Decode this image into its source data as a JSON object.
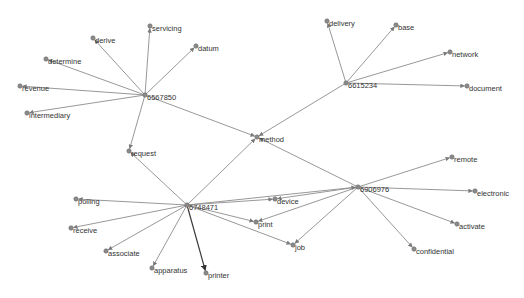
{
  "diagram": {
    "type": "network-graph",
    "nodes": [
      {
        "id": "6567850",
        "label": "6567850",
        "x": 145,
        "y": 95,
        "kind": "hub"
      },
      {
        "id": "6615234",
        "label": "6615234",
        "x": 346,
        "y": 83,
        "kind": "hub"
      },
      {
        "id": "6906976",
        "label": "6906976",
        "x": 358,
        "y": 187,
        "kind": "hub"
      },
      {
        "id": "6748471",
        "label": "6748471",
        "x": 187,
        "y": 205,
        "kind": "hub"
      },
      {
        "id": "method",
        "label": "method",
        "x": 257,
        "y": 137,
        "kind": "term"
      },
      {
        "id": "request",
        "label": "request",
        "x": 129,
        "y": 151,
        "kind": "term"
      },
      {
        "id": "servicing",
        "label": "servicing",
        "x": 150,
        "y": 26,
        "kind": "term"
      },
      {
        "id": "derive",
        "label": "derive",
        "x": 93,
        "y": 38,
        "kind": "term"
      },
      {
        "id": "datum",
        "label": "datum",
        "x": 196,
        "y": 46,
        "kind": "term"
      },
      {
        "id": "determine",
        "label": "determine",
        "x": 46,
        "y": 59,
        "kind": "term"
      },
      {
        "id": "revenue",
        "label": "revenue",
        "x": 20,
        "y": 86,
        "kind": "term"
      },
      {
        "id": "intermediary",
        "label": "intermediary",
        "x": 27,
        "y": 113,
        "kind": "term"
      },
      {
        "id": "delivery",
        "label": "delivery",
        "x": 327,
        "y": 21,
        "kind": "term"
      },
      {
        "id": "base",
        "label": "base",
        "x": 396,
        "y": 25,
        "kind": "term"
      },
      {
        "id": "network",
        "label": "network",
        "x": 450,
        "y": 52,
        "kind": "term"
      },
      {
        "id": "document",
        "label": "document",
        "x": 467,
        "y": 86,
        "kind": "term"
      },
      {
        "id": "remote",
        "label": "remote",
        "x": 452,
        "y": 157,
        "kind": "term"
      },
      {
        "id": "electronic",
        "label": "electronic",
        "x": 475,
        "y": 191,
        "kind": "term"
      },
      {
        "id": "activate",
        "label": "activate",
        "x": 457,
        "y": 224,
        "kind": "term"
      },
      {
        "id": "confidential",
        "label": "confidential",
        "x": 414,
        "y": 249,
        "kind": "term"
      },
      {
        "id": "polling",
        "label": "polling",
        "x": 76,
        "y": 199,
        "kind": "term"
      },
      {
        "id": "receive",
        "label": "receive",
        "x": 71,
        "y": 228,
        "kind": "term"
      },
      {
        "id": "associate",
        "label": "associate",
        "x": 106,
        "y": 251,
        "kind": "term"
      },
      {
        "id": "apparatus",
        "label": "apparatus",
        "x": 152,
        "y": 268,
        "kind": "term"
      },
      {
        "id": "printer",
        "label": "printer",
        "x": 206,
        "y": 273,
        "kind": "term"
      },
      {
        "id": "device",
        "label": "device",
        "x": 275,
        "y": 199,
        "kind": "term"
      },
      {
        "id": "print",
        "label": "print",
        "x": 256,
        "y": 222,
        "kind": "term"
      },
      {
        "id": "job",
        "label": "job",
        "x": 293,
        "y": 245,
        "kind": "term"
      }
    ],
    "edges": [
      {
        "from": "6567850",
        "to": "servicing"
      },
      {
        "from": "6567850",
        "to": "derive"
      },
      {
        "from": "6567850",
        "to": "datum"
      },
      {
        "from": "6567850",
        "to": "determine"
      },
      {
        "from": "6567850",
        "to": "revenue"
      },
      {
        "from": "6567850",
        "to": "intermediary"
      },
      {
        "from": "6567850",
        "to": "request"
      },
      {
        "from": "6567850",
        "to": "method"
      },
      {
        "from": "6615234",
        "to": "delivery"
      },
      {
        "from": "6615234",
        "to": "base"
      },
      {
        "from": "6615234",
        "to": "network"
      },
      {
        "from": "6615234",
        "to": "document"
      },
      {
        "from": "6615234",
        "to": "method"
      },
      {
        "from": "6906976",
        "to": "method"
      },
      {
        "from": "6906976",
        "to": "remote"
      },
      {
        "from": "6906976",
        "to": "electronic"
      },
      {
        "from": "6906976",
        "to": "activate"
      },
      {
        "from": "6906976",
        "to": "confidential"
      },
      {
        "from": "6906976",
        "to": "device"
      },
      {
        "from": "6906976",
        "to": "print"
      },
      {
        "from": "6906976",
        "to": "job"
      },
      {
        "from": "6748471",
        "to": "request"
      },
      {
        "from": "6748471",
        "to": "method"
      },
      {
        "from": "6748471",
        "to": "polling"
      },
      {
        "from": "6748471",
        "to": "receive"
      },
      {
        "from": "6748471",
        "to": "associate"
      },
      {
        "from": "6748471",
        "to": "apparatus"
      },
      {
        "from": "6748471",
        "to": "printer",
        "strong": true
      },
      {
        "from": "6748471",
        "to": "device"
      },
      {
        "from": "6748471",
        "to": "print"
      },
      {
        "from": "6748471",
        "to": "job"
      },
      {
        "from": "6748471",
        "to": "6906976"
      }
    ],
    "colors": {
      "edge": "#8c8c8c",
      "edge_strong": "#3a3a3a",
      "node": "#8a8a8a",
      "label": "#333333",
      "background": "#ffffff"
    }
  }
}
